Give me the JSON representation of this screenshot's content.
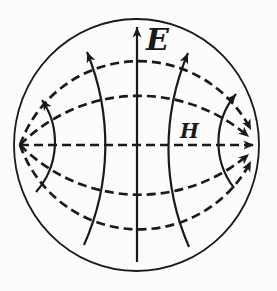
{
  "diagram": {
    "labels": {
      "e_field": "E",
      "h_field": "H"
    },
    "colors": {
      "line": "#1a1a1a",
      "background": "#fcfcfc"
    }
  }
}
